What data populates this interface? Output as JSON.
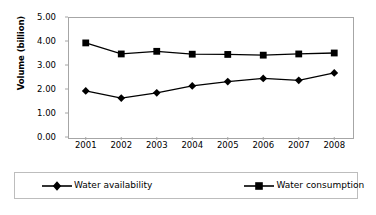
{
  "chart_data": {
    "type": "line",
    "title": "",
    "xlabel": "",
    "ylabel": "Volume (billion)",
    "categories": [
      "2001",
      "2002",
      "2003",
      "2004",
      "2005",
      "2006",
      "2007",
      "2008"
    ],
    "ylim": [
      0,
      5
    ],
    "ytick_labels": [
      "0.00",
      "1.00",
      "2.00",
      "3.00",
      "4.00",
      "5.00"
    ],
    "ytick_values": [
      0,
      1,
      2,
      3,
      4,
      5
    ],
    "grid": false,
    "legend_position": "bottom",
    "series": [
      {
        "name": "Water availability",
        "marker": "diamond",
        "color": "#000000",
        "values": [
          1.92,
          1.62,
          1.84,
          2.13,
          2.31,
          2.44,
          2.36,
          2.67
        ]
      },
      {
        "name": "Water consumption",
        "marker": "square",
        "color": "#000000",
        "values": [
          3.92,
          3.46,
          3.57,
          3.45,
          3.44,
          3.41,
          3.46,
          3.5
        ]
      }
    ]
  },
  "legend": {
    "items": [
      {
        "label": "Water availability",
        "marker": "diamond-marker-icon"
      },
      {
        "label": "Water consumption",
        "marker": "square-marker-icon"
      }
    ]
  },
  "colors": {
    "series": "#000000",
    "frame": "#a6a6a6",
    "legend_border": "#bdbdbd",
    "background": "#ffffff"
  }
}
